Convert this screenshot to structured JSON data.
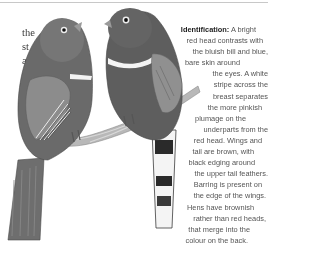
{
  "page": {
    "left_column_fragments": [
      "the",
      "st",
      "a",
      "",
      "t"
    ],
    "identification": {
      "heading": "Identification:",
      "lines": [
        " A bright",
        "red head contrasts with",
        "the bluish bill and blue,",
        "bare skin around",
        "the eyes. A white",
        "stripe across the",
        "breast separates",
        "the more pinkish",
        "plumage on the",
        "underparts from the",
        "red head. Wings and",
        "tail are brown, with",
        "black edging around",
        "the upper tail feathers.",
        "Barring is present on",
        "the edge of the wings.",
        "Hens have brownish",
        "rather than red heads,",
        "that merge into the",
        "colour on the back."
      ]
    },
    "illustration": {
      "subject": "two trogon birds perched on a twisted branch",
      "colors": {
        "plumage_dark": "#5a5a5a",
        "plumage_mid": "#7a7a7a",
        "breast_stripe": "#f2f2f2",
        "branch": "#b5b5b5",
        "wing": "#8c8c8c"
      }
    }
  }
}
